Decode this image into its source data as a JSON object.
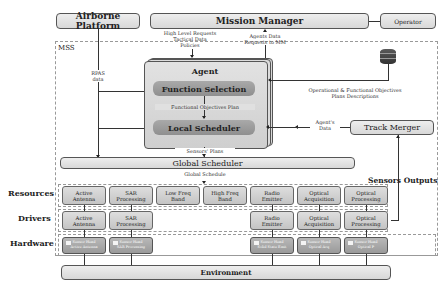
{
  "top": {
    "airborne_platform": "Airborne Platform",
    "mission_manager": "Mission Manager",
    "operator": "Operator"
  },
  "mss_label": "MSS",
  "flows": {
    "rpas_data_1": "RPAS",
    "rpas_data_2": "data",
    "mm_to_agent_1": "High Level Requests",
    "mm_to_agent_2": "Tactical Data",
    "mm_to_agent_3": "Policies",
    "agent_to_mm_1": "Agents Data",
    "agent_to_mm_2": "Requests to MM",
    "db_to_agent_1": "Operational & Functional Objectives",
    "db_to_agent_2": "Plans Descriptions",
    "functional_plan": "Functional Objectives Plan",
    "agents_data_1": "Agent's",
    "agents_data_2": "Data",
    "sensors_plans": "Sensors' Plans",
    "global_schedule": "Global Schedule",
    "sensors_outputs": "Sensors Outputs"
  },
  "agent": {
    "title": "Agent",
    "function_selection": "Function Selection",
    "local_scheduler": "Local Scheduler"
  },
  "database": {
    "icon": "database-icon",
    "label": "DB"
  },
  "track_merger": "Track Merger",
  "global_scheduler": "Global Scheduler",
  "rows": {
    "resources": "Resources",
    "drivers": "Drivers",
    "hardware": "Hardware"
  },
  "resources": [
    {
      "l1": "Active",
      "l2": "Antenna"
    },
    {
      "l1": "SAR",
      "l2": "Processing"
    },
    {
      "l1": "Low Freq",
      "l2": "Band"
    },
    {
      "l1": "High Freq",
      "l2": "Band"
    },
    {
      "l1": "Radio",
      "l2": "Emitter"
    },
    {
      "l1": "Optical",
      "l2": "Acquisition"
    },
    {
      "l1": "Optical",
      "l2": "Processing"
    }
  ],
  "drivers": [
    {
      "l1": "Active",
      "l2": "Antenna"
    },
    {
      "l1": "SAR",
      "l2": "Processing"
    },
    {
      "l1": "Radio",
      "l2": "Emitter"
    },
    {
      "l1": "Optical",
      "l2": "Acquisition"
    },
    {
      "l1": "Optical",
      "l2": "Processing"
    }
  ],
  "hardware": [
    {
      "l1": "Sensor Head",
      "l2": "Active Antenna"
    },
    {
      "l1": "Sensor Head",
      "l2": "SAR Processing"
    },
    {
      "l1": "Sensor Head",
      "l2": "Solid State Emit"
    },
    {
      "l1": "Sensor Head",
      "l2": "Optical Acq"
    },
    {
      "l1": "Sensor Head",
      "l2": "Optical P"
    }
  ],
  "environment": "Environment"
}
